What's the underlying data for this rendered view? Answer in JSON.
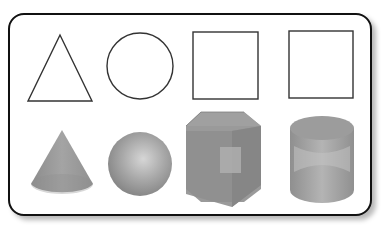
{
  "figure": {
    "top_row": [
      {
        "name": "triangle",
        "kind": "2d-outline"
      },
      {
        "name": "circle",
        "kind": "2d-outline"
      },
      {
        "name": "square",
        "kind": "2d-outline"
      },
      {
        "name": "square",
        "kind": "2d-outline"
      }
    ],
    "bottom_row": [
      {
        "name": "cone",
        "kind": "3d-solid"
      },
      {
        "name": "sphere",
        "kind": "3d-solid"
      },
      {
        "name": "cube",
        "kind": "3d-solid"
      },
      {
        "name": "cylinder",
        "kind": "3d-solid"
      }
    ],
    "colors": {
      "outline": "#333333",
      "frame": "#111111",
      "solid_base": "#8a8a8a",
      "solid_light": "#c8c8c8",
      "solid_dark": "#7a7a7a"
    }
  }
}
